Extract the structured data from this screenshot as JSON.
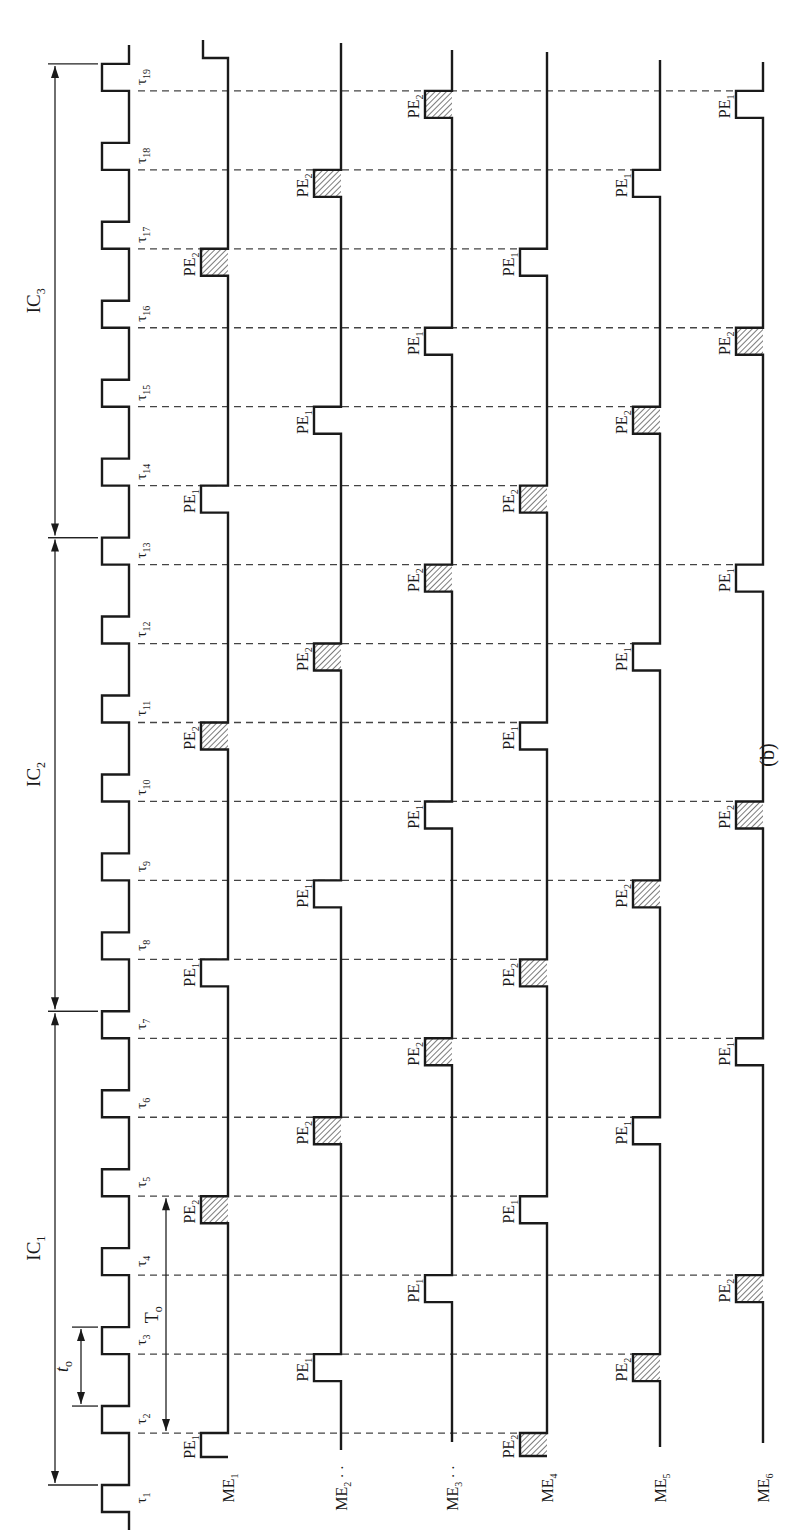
{
  "figure": {
    "caption": "(b)",
    "orientation": "rotated 90 degrees counter-clockwise (time axis runs bottom to top)",
    "clock": {
      "pulse_labels": [
        "τ1",
        "τ2",
        "τ3",
        "τ4",
        "τ5",
        "τ6",
        "τ7",
        "τ8",
        "τ9",
        "τ10",
        "τ11",
        "τ12",
        "τ13",
        "τ14",
        "τ15",
        "τ16",
        "τ17",
        "τ18",
        "τ19"
      ]
    },
    "intervals": [
      {
        "label": "IC",
        "sub": "1",
        "from_pulse": 1,
        "to_pulse": 7
      },
      {
        "label": "IC",
        "sub": "2",
        "from_pulse": 7,
        "to_pulse": 13
      },
      {
        "label": "IC",
        "sub": "3",
        "from_pulse": 13,
        "to_pulse": 19
      }
    ],
    "dimensions": [
      {
        "label": "t",
        "sub": "o",
        "meaning": "clock period",
        "from_pulse": 2,
        "to_pulse": 3
      },
      {
        "label": "T",
        "sub": "o",
        "meaning": "span",
        "from_pulse": 2,
        "to_pulse": 5
      }
    ],
    "channels": [
      {
        "label": "ME",
        "sub": "1",
        "dots": false
      },
      {
        "label": "ME",
        "sub": "2",
        "dots": true
      },
      {
        "label": "ME",
        "sub": "3",
        "dots": true
      },
      {
        "label": "ME",
        "sub": "4",
        "dots": false
      },
      {
        "label": "ME",
        "sub": "5",
        "dots": false
      },
      {
        "label": "ME",
        "sub": "6",
        "dots": false
      }
    ],
    "events": [
      {
        "tau": 2,
        "PE1": "ME1",
        "PE2": "ME4"
      },
      {
        "tau": 3,
        "PE1": "ME2",
        "PE2": "ME5"
      },
      {
        "tau": 4,
        "PE1": "ME3",
        "PE2": "ME6"
      },
      {
        "tau": 5,
        "PE1": "ME4",
        "PE2": "ME1"
      },
      {
        "tau": 6,
        "PE1": "ME5",
        "PE2": "ME2"
      },
      {
        "tau": 7,
        "PE1": "ME6",
        "PE2": "ME3"
      },
      {
        "tau": 8,
        "PE1": "ME1",
        "PE2": "ME4"
      },
      {
        "tau": 9,
        "PE1": "ME2",
        "PE2": "ME5"
      },
      {
        "tau": 10,
        "PE1": "ME3",
        "PE2": "ME6"
      },
      {
        "tau": 11,
        "PE1": "ME4",
        "PE2": "ME1"
      },
      {
        "tau": 12,
        "PE1": "ME5",
        "PE2": "ME2"
      },
      {
        "tau": 13,
        "PE1": "ME6",
        "PE2": "ME3"
      },
      {
        "tau": 14,
        "PE1": "ME1",
        "PE2": "ME4"
      },
      {
        "tau": 15,
        "PE1": "ME2",
        "PE2": "ME5"
      },
      {
        "tau": 16,
        "PE1": "ME3",
        "PE2": "ME6"
      },
      {
        "tau": 17,
        "PE1": "ME4",
        "PE2": "ME1"
      },
      {
        "tau": 18,
        "PE1": "ME5",
        "PE2": "ME2"
      },
      {
        "tau": 19,
        "PE1": "ME6",
        "PE2": "ME3"
      }
    ],
    "pulse_legend": {
      "PE1": {
        "label": "PE",
        "sub": "1",
        "fill": "open"
      },
      "PE2": {
        "label": "PE",
        "sub": "2",
        "fill": "hatched"
      }
    },
    "colors": {
      "ink": "#1a1a1a",
      "dash": "#444444",
      "background": "#ffffff"
    }
  }
}
